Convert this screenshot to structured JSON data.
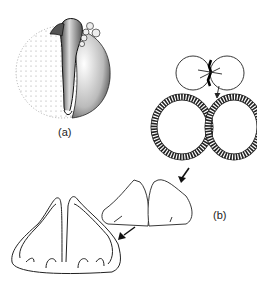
{
  "figure": {
    "panel_a": {
      "label": "(a)",
      "description": "embryo on yolk sphere, stippled"
    },
    "panel_b": {
      "label": "(b)",
      "stages": [
        "two lobes with central stalk",
        "paired epithelial rings",
        "paired solid lobes",
        "paired folded double-walled lobes"
      ]
    }
  }
}
